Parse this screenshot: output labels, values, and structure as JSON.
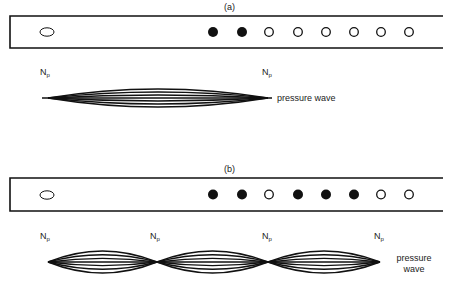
{
  "panels": [
    {
      "id": "a",
      "label": "(a)",
      "tube": {
        "top": 16,
        "bottom": 48,
        "left": 10,
        "right": 443
      },
      "mouthpiece": {
        "cx": 47,
        "cy": 32
      },
      "holes": [
        {
          "x": 213,
          "closed": true
        },
        {
          "x": 242,
          "closed": true
        },
        {
          "x": 269,
          "closed": false
        },
        {
          "x": 298,
          "closed": false
        },
        {
          "x": 326,
          "closed": false
        },
        {
          "x": 354,
          "closed": false
        },
        {
          "x": 381,
          "closed": false
        },
        {
          "x": 409,
          "closed": false
        }
      ],
      "node_label": "N",
      "node_sub": "p",
      "nodes": [
        48,
        268
      ],
      "wave_center_y": 98,
      "wave_label": "pressure wave"
    },
    {
      "id": "b",
      "label": "(b)",
      "tube": {
        "top": 178,
        "bottom": 211,
        "left": 10,
        "right": 443
      },
      "mouthpiece": {
        "cx": 47,
        "cy": 195
      },
      "holes": [
        {
          "x": 213,
          "closed": true
        },
        {
          "x": 242,
          "closed": true
        },
        {
          "x": 269,
          "closed": false
        },
        {
          "x": 298,
          "closed": true
        },
        {
          "x": 326,
          "closed": true
        },
        {
          "x": 354,
          "closed": true
        },
        {
          "x": 381,
          "closed": false
        },
        {
          "x": 409,
          "closed": false
        }
      ],
      "node_label": "N",
      "node_sub": "p",
      "nodes": [
        48,
        157,
        268,
        380
      ],
      "wave_center_y": 262,
      "wave_label_line1": "pressure",
      "wave_label_line2": "wave"
    }
  ],
  "colors": {
    "ink": "#111111",
    "text": "#222222",
    "background": "#ffffff"
  }
}
